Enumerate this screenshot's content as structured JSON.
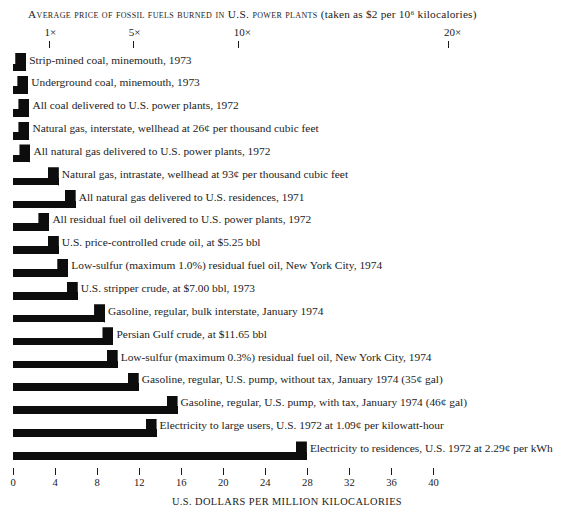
{
  "chart_data": {
    "type": "bar",
    "title": "AVERAGE PRICE OF FOSSIL FUELS BURNED IN U.S. POWER PLANTS (taken as $2 per 10⁶ kilocalories)",
    "title_main": "Average price of fossil fuels  burned in U.S. power plants",
    "title_paren": "(taken as $2 per 10⁶ kilocalories)",
    "xlabel": "U.S. DOLLARS PER MILLION KILOCALORIES",
    "ylabel": "",
    "xlim": [
      0,
      40
    ],
    "grid": false,
    "legend": "none",
    "orientation": "horizontal",
    "xticks": [
      0,
      4,
      8,
      12,
      16,
      20,
      24,
      28,
      32,
      36,
      40
    ],
    "xticklabels": [
      "0",
      "4",
      "8",
      "12",
      "16",
      "20",
      "24",
      "28",
      "32",
      "36",
      "40"
    ],
    "secondary_axis": {
      "position": "top",
      "label": "",
      "ticks_dollars": [
        2,
        10,
        20,
        40
      ],
      "ticklabels": [
        "1×",
        "5×",
        "10×",
        "20×"
      ],
      "note": "multiples of the $2 per million kilocalorie base price"
    },
    "categories": [
      "Strip-mined coal, minemouth, 1973",
      "Underground coal, minemouth, 1973",
      "All coal delivered to U.S. power plants, 1972",
      "Natural gas, interstate, wellhead at 26¢ per thousand cubic feet",
      "All natural gas delivered to U.S. power plants, 1972",
      "Natural gas, intrastate, wellhead at 93¢ per thousand cubic feet",
      "All natural gas delivered to U.S. residences, 1971",
      "All residual fuel oil delivered to U.S. power plants, 1972",
      "U.S. price-controlled crude oil, at $5.25 bbl",
      "Low-sulfur (maximum 1.0%) residual fuel oil, New York City, 1974",
      "U.S. stripper crude, at $7.00 bbl, 1973",
      "Gasoline, regular, bulk interstate, January 1974",
      "Persian Gulf crude, at $11.65 bbl",
      "Low-sulfur (maximum 0.3%) residual fuel oil, New York City, 1974",
      "Gasoline, regular, U.S. pump, without tax, January 1974 (35¢ gal)",
      "Gasoline, regular, U.S. pump, with tax, January 1974 (46¢ gal)",
      "Electricity to large users, U.S. 1972 at 1.09¢ per kilowatt-hour",
      "Electricity to residences, U.S. 1972 at 2.29¢ per kWh"
    ],
    "values": [
      1.3,
      1.5,
      1.6,
      1.6,
      1.7,
      4.4,
      6.0,
      3.5,
      4.4,
      5.3,
      6.2,
      8.8,
      9.6,
      10.0,
      12.0,
      15.7,
      13.7,
      28.0
    ],
    "value_unit": "U.S. dollars per million kilocalories",
    "bar_color": "#0d0d0d"
  },
  "axis_colors": {
    "tick": "#1a1a1a",
    "text": "#1c1c1c",
    "background": "#ffffff"
  }
}
